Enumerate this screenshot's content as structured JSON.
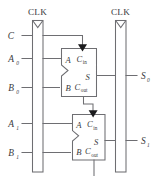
{
  "diagram": {
    "type": "logic-schematic",
    "colors": {
      "wire": "#6e6e72",
      "text": "#3a3a3d",
      "arrow": "#1b1b1d",
      "background": "#ffffff"
    }
  },
  "clocks": [
    {
      "id": "clk-left",
      "label": "CLK"
    },
    {
      "id": "clk-right",
      "label": "CLK"
    }
  ],
  "registers": [
    {
      "id": "input-register",
      "clock_label": "CLK"
    },
    {
      "id": "output-register",
      "clock_label": "CLK"
    }
  ],
  "inputs": [
    {
      "id": "carry-in",
      "label": "C",
      "base": "C",
      "sub": ""
    },
    {
      "id": "a0",
      "label": "A0",
      "base": "A",
      "sub": "0"
    },
    {
      "id": "b0",
      "label": "B0",
      "base": "B",
      "sub": "0"
    },
    {
      "id": "a1",
      "label": "A1",
      "base": "A",
      "sub": "1"
    },
    {
      "id": "b1",
      "label": "B1",
      "base": "B",
      "sub": "1"
    }
  ],
  "outputs": [
    {
      "id": "s0",
      "label": "S0",
      "base": "S",
      "sub": "0"
    },
    {
      "id": "s1",
      "label": "S1",
      "base": "S",
      "sub": "1"
    }
  ],
  "adders": [
    {
      "id": "full-adder-0",
      "ports": {
        "a": "A",
        "b": "B",
        "cin_base": "C",
        "cin_sub": "in",
        "sum": "S",
        "cout_base": "C",
        "cout_sub": "out"
      }
    },
    {
      "id": "full-adder-1",
      "ports": {
        "a": "A",
        "b": "B",
        "cin_base": "C",
        "cin_sub": "in",
        "sum": "S",
        "cout_base": "C",
        "cout_sub": "out"
      }
    }
  ]
}
